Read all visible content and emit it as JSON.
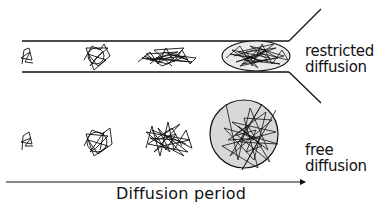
{
  "labels": {
    "restricted_line1": "restricted",
    "restricted_line2": "diffusion",
    "free_line1": "free",
    "free_line2": "diffusion",
    "axis": "Diffusion period"
  },
  "colors": {
    "ink": "#111111",
    "circle_fill": "#d8d8d8"
  },
  "rows": {
    "restricted": {
      "stages": 4,
      "final_shape": "ellipse"
    },
    "free": {
      "stages": 4,
      "final_shape": "circle"
    }
  }
}
